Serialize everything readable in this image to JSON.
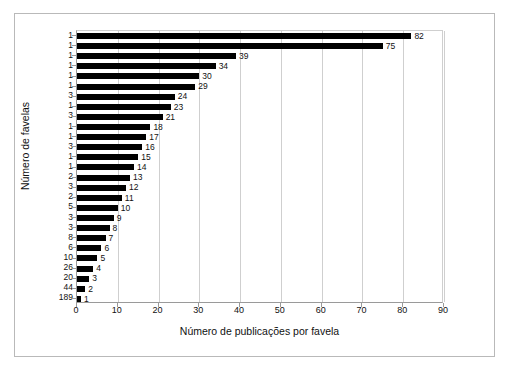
{
  "chart_data": {
    "type": "bar",
    "orientation": "horizontal",
    "title": "",
    "xlabel": "Número de publicações por favela",
    "ylabel": "Número de favelas",
    "xlim": [
      0,
      90
    ],
    "xticks": [
      0,
      10,
      20,
      30,
      40,
      50,
      60,
      70,
      80,
      90
    ],
    "grid": true,
    "gridlines": "vertical",
    "legend": null,
    "bar_color": "#000000",
    "categories": [
      "1",
      "1",
      "1",
      "1",
      "1",
      "1",
      "3",
      "1",
      "3",
      "1",
      "1",
      "3",
      "1",
      "1",
      "2",
      "3",
      "2",
      "5",
      "3",
      "3",
      "8",
      "6",
      "10",
      "26",
      "20",
      "44",
      "189"
    ],
    "values": [
      82,
      75,
      39,
      34,
      30,
      29,
      24,
      23,
      21,
      18,
      17,
      16,
      15,
      14,
      13,
      12,
      11,
      10,
      9,
      8,
      7,
      6,
      5,
      4,
      3,
      2,
      1
    ],
    "data_labels": [
      "82",
      "75",
      "39",
      "34",
      "30",
      "29",
      "24",
      "23",
      "21",
      "18",
      "17",
      "16",
      "15",
      "14",
      "13",
      "12",
      "11",
      "10",
      "9",
      "8",
      "7",
      "6",
      "5",
      "4",
      "3",
      "2",
      "1"
    ],
    "rows": [
      {
        "favelas": "1",
        "publicacoes": 82,
        "label": "82"
      },
      {
        "favelas": "1",
        "publicacoes": 75,
        "label": "75"
      },
      {
        "favelas": "1",
        "publicacoes": 39,
        "label": "39"
      },
      {
        "favelas": "1",
        "publicacoes": 34,
        "label": "34"
      },
      {
        "favelas": "1",
        "publicacoes": 30,
        "label": "30"
      },
      {
        "favelas": "1",
        "publicacoes": 29,
        "label": "29"
      },
      {
        "favelas": "3",
        "publicacoes": 24,
        "label": "24"
      },
      {
        "favelas": "1",
        "publicacoes": 23,
        "label": "23"
      },
      {
        "favelas": "3",
        "publicacoes": 21,
        "label": "21"
      },
      {
        "favelas": "1",
        "publicacoes": 18,
        "label": "18"
      },
      {
        "favelas": "1",
        "publicacoes": 17,
        "label": "17"
      },
      {
        "favelas": "3",
        "publicacoes": 16,
        "label": "16"
      },
      {
        "favelas": "1",
        "publicacoes": 15,
        "label": "15"
      },
      {
        "favelas": "1",
        "publicacoes": 14,
        "label": "14"
      },
      {
        "favelas": "2",
        "publicacoes": 13,
        "label": "13"
      },
      {
        "favelas": "3",
        "publicacoes": 12,
        "label": "12"
      },
      {
        "favelas": "2",
        "publicacoes": 11,
        "label": "11"
      },
      {
        "favelas": "5",
        "publicacoes": 10,
        "label": "10"
      },
      {
        "favelas": "3",
        "publicacoes": 9,
        "label": "9"
      },
      {
        "favelas": "3",
        "publicacoes": 8,
        "label": "8"
      },
      {
        "favelas": "8",
        "publicacoes": 7,
        "label": "7"
      },
      {
        "favelas": "6",
        "publicacoes": 6,
        "label": "6"
      },
      {
        "favelas": "10",
        "publicacoes": 5,
        "label": "5"
      },
      {
        "favelas": "26",
        "publicacoes": 4,
        "label": "4"
      },
      {
        "favelas": "20",
        "publicacoes": 3,
        "label": "3"
      },
      {
        "favelas": "44",
        "publicacoes": 2,
        "label": "2"
      },
      {
        "favelas": "189",
        "publicacoes": 1,
        "label": "1"
      }
    ]
  }
}
